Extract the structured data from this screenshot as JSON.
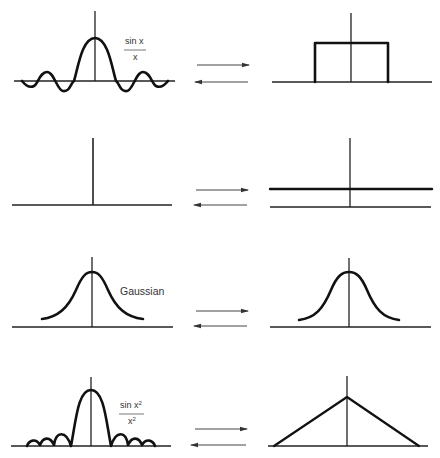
{
  "arrow_direction": "bidirectional",
  "colors": {
    "ink": "#111111",
    "axis": "#222222",
    "arrow": "#444444",
    "background": "#ffffff"
  },
  "rows": [
    {
      "left": {
        "function": "sinc",
        "label_num": "sin  x",
        "label_den": "x"
      },
      "right": {
        "function": "rectangle"
      }
    },
    {
      "left": {
        "function": "delta (impulse)"
      },
      "right": {
        "function": "constant"
      }
    },
    {
      "left": {
        "function": "gaussian",
        "label": "Gaussian"
      },
      "right": {
        "function": "gaussian"
      }
    },
    {
      "left": {
        "function": "sinc squared",
        "label_num": "sin  x",
        "label_num_sup": "2",
        "label_den": "x",
        "label_den_sup": "2"
      },
      "right": {
        "function": "triangle"
      }
    }
  ]
}
